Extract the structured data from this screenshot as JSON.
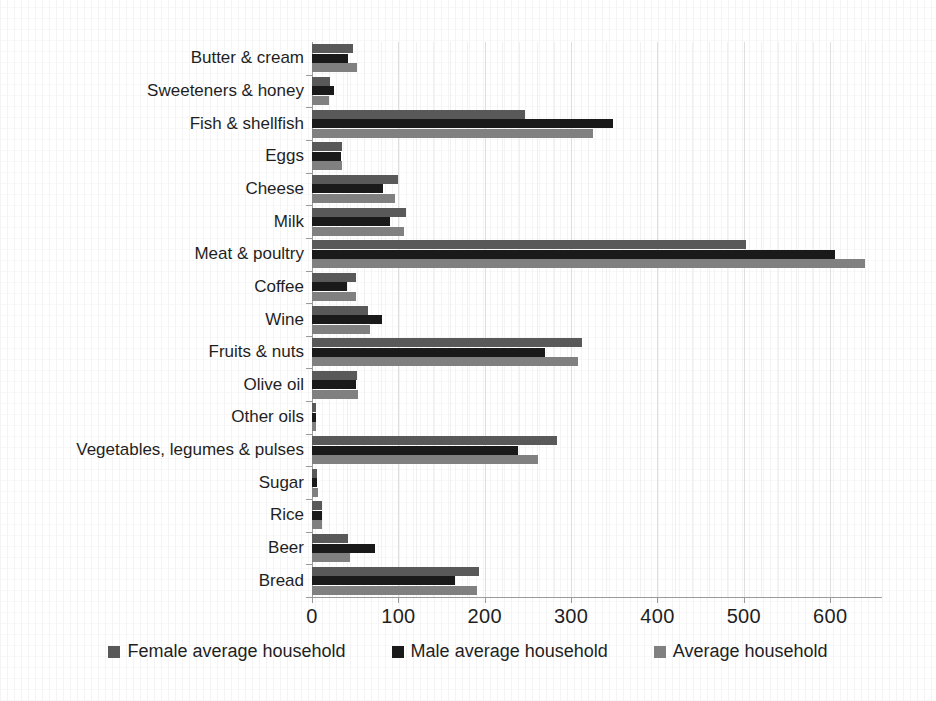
{
  "chart_data": {
    "type": "bar",
    "orientation": "horizontal",
    "title": "",
    "xlabel": "",
    "ylabel": "",
    "xlim": [
      0,
      660
    ],
    "xticks": [
      0,
      100,
      200,
      300,
      400,
      500,
      600
    ],
    "xtick_labels": [
      "0",
      "100",
      "200",
      "300",
      "400",
      "500",
      "600"
    ],
    "grid": true,
    "legend_position": "bottom",
    "categories": [
      "Butter & cream",
      "Sweeteners & honey",
      "Fish & shellfish",
      "Eggs",
      "Cheese",
      "Milk",
      "Meat & poultry",
      "Coffee",
      "Wine",
      "Fruits & nuts",
      "Olive oil",
      "Other oils",
      "Vegetables, legumes & pulses",
      "Sugar",
      "Rice",
      "Beer",
      "Bread"
    ],
    "series": [
      {
        "name": "Female average household",
        "color": "#595959",
        "values": [
          47,
          21,
          247,
          35,
          100,
          109,
          502,
          51,
          65,
          313,
          52,
          5,
          284,
          6,
          11,
          42,
          193
        ]
      },
      {
        "name": "Male average household",
        "color": "#1a1a1a",
        "values": [
          42,
          25,
          348,
          34,
          82,
          90,
          606,
          40,
          81,
          270,
          51,
          5,
          239,
          6,
          12,
          73,
          166
        ]
      },
      {
        "name": "Average household",
        "color": "#808080",
        "values": [
          52,
          20,
          325,
          35,
          96,
          107,
          640,
          51,
          67,
          308,
          53,
          5,
          262,
          7,
          11,
          44,
          191
        ]
      }
    ]
  },
  "legend": {
    "items": [
      {
        "label": "Female average household",
        "color": "#595959"
      },
      {
        "label": "Male average household",
        "color": "#1a1a1a"
      },
      {
        "label": "Average household",
        "color": "#808080"
      }
    ]
  }
}
